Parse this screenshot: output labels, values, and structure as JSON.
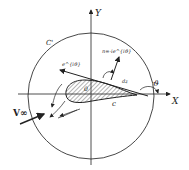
{
  "diagram": {
    "axes": {
      "x_label": "X",
      "y_label": "Y",
      "origin_label": "0"
    },
    "contours": {
      "outer_circle_label": "C'",
      "airfoil_contour_label": "c"
    },
    "vectors": {
      "tangent_label": "e^{iϑ}",
      "normal_label": "n=-ie^{iϑ}",
      "element_label": "dz",
      "angle_label": "ϑ",
      "freestream_label": "V∞"
    },
    "colors": {
      "line": "#222222",
      "background": "#ffffff"
    }
  }
}
